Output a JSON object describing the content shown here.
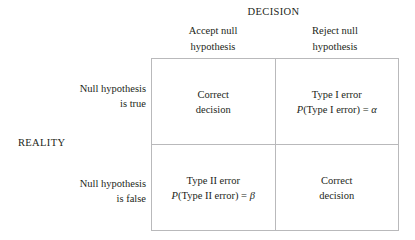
{
  "figure": {
    "column_axis_title": "DECISION",
    "row_axis_title": "REALITY",
    "column_headers": [
      {
        "line1": "Accept null",
        "line2": "hypothesis"
      },
      {
        "line1": "Reject null",
        "line2": "hypothesis"
      }
    ],
    "row_headers": [
      {
        "line1": "Null hypothesis",
        "line2": "is true"
      },
      {
        "line1": "Null hypothesis",
        "line2": "is false"
      }
    ],
    "cells": [
      {
        "id": "true-accept",
        "line1": "Correct",
        "line2": "decision",
        "formula_var": "",
        "formula_body": "",
        "formula_symbol": ""
      },
      {
        "id": "true-reject",
        "line1": "Type I error",
        "line2": "",
        "formula_var": "P",
        "formula_body": "(Type I error) = ",
        "formula_symbol": "α"
      },
      {
        "id": "false-accept",
        "line1": "Type II error",
        "line2": "",
        "formula_var": "P",
        "formula_body": "(Type II error) = ",
        "formula_symbol": "β"
      },
      {
        "id": "false-reject",
        "line1": "Correct",
        "line2": "decision",
        "formula_var": "",
        "formula_body": "",
        "formula_symbol": ""
      }
    ],
    "colors": {
      "text": "#231f20",
      "border": "#b9b9bb",
      "background": "#ffffff"
    }
  }
}
